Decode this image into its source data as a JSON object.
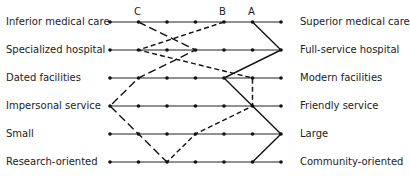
{
  "chart_data": {
    "type": "line",
    "title": "",
    "scale_points": 7,
    "rows": [
      {
        "left": "Inferior medical care",
        "right": "Superior medical care"
      },
      {
        "left": "Specialized hospital",
        "right": "Full-service hospital"
      },
      {
        "left": "Dated facilities",
        "right": "Modern facilities"
      },
      {
        "left": "Impersonal service",
        "right": "Friendly service"
      },
      {
        "left": "Small",
        "right": "Large"
      },
      {
        "left": "Research-oriented",
        "right": "Community-oriented"
      }
    ],
    "series": [
      {
        "name": "A",
        "style": "solid",
        "values": [
          6,
          7,
          5,
          6,
          7,
          6
        ]
      },
      {
        "name": "B",
        "style": "short-dash",
        "values": [
          5,
          2,
          6,
          6,
          4,
          3
        ]
      },
      {
        "name": "C",
        "style": "long-dash",
        "values": [
          2,
          4,
          2,
          1,
          2,
          3
        ]
      }
    ],
    "grid": false,
    "legend": "series labels above first row"
  },
  "labels": {
    "left": [
      "Inferior medical care",
      "Specialized hospital",
      "Dated facilities",
      "Impersonal service",
      "Small",
      "Research-oriented"
    ],
    "right": [
      "Superior medical care",
      "Full-service hospital",
      "Modern facilities",
      "Friendly service",
      "Large",
      "Community-oriented"
    ],
    "series": [
      "A",
      "B",
      "C"
    ]
  }
}
